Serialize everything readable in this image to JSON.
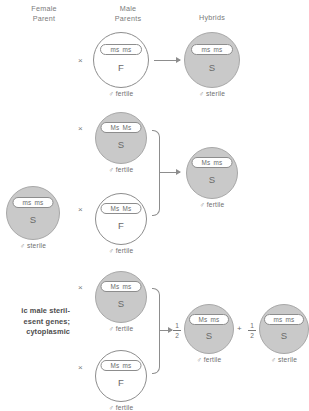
{
  "headers": [
    {
      "id": "female-parent",
      "text": "Female\nParent"
    },
    {
      "id": "male-parents",
      "text": "Male\nParents"
    },
    {
      "id": "hybrids",
      "text": "Hybrids"
    }
  ],
  "symbols": {
    "cross": "×",
    "plus": "+",
    "male": "♂",
    "fertile": "fertile",
    "sterile": "sterile",
    "half_numerator": "1",
    "half_denominator": "2"
  },
  "circles": {
    "r1_male": {
      "alleles": [
        "ms",
        "ms"
      ],
      "cytoplasm": "F",
      "fertility": "♂ fertile",
      "shaded": false
    },
    "r1_hybrid": {
      "alleles": [
        "ms",
        "ms"
      ],
      "cytoplasm": "S",
      "fertility": "♂ sterile",
      "shaded": true
    },
    "female_parent": {
      "alleles": [
        "ms",
        "ms"
      ],
      "cytoplasm": "S",
      "fertility": "♂ sterile",
      "shaded": true
    },
    "r2_male_top": {
      "alleles": [
        "Ms",
        "Ms"
      ],
      "cytoplasm": "S",
      "fertility": "♂ fertile",
      "shaded": true
    },
    "r2_male_bottom": {
      "alleles": [
        "Ms",
        "Ms"
      ],
      "cytoplasm": "F",
      "fertility": "♂ fertile",
      "shaded": false
    },
    "r2_hybrid": {
      "alleles": [
        "Ms",
        "ms"
      ],
      "cytoplasm": "S",
      "fertility": "♂ fertile",
      "shaded": true
    },
    "r3_male_top": {
      "alleles": [
        "Ms",
        "ms"
      ],
      "cytoplasm": "S",
      "fertility": "♂ fertile",
      "shaded": true
    },
    "r3_male_bottom": {
      "alleles": [
        "Ms",
        "ms"
      ],
      "cytoplasm": "F",
      "fertility": "♂ fertile",
      "shaded": false
    },
    "r3_hybrid_left": {
      "alleles": [
        "Ms",
        "ms"
      ],
      "cytoplasm": "S",
      "fertility": "♂ fertile",
      "shaded": true
    },
    "r3_hybrid_right": {
      "alleles": [
        "ms",
        "ms"
      ],
      "cytoplasm": "S",
      "fertility": "♂ sterile",
      "shaded": true
    }
  },
  "caption": "ic male steril-\nesent genes;\ncytoplasmic",
  "colors": {
    "shaded_fill": "#c9c9c9",
    "open_fill": "#ffffff",
    "stroke": "#8d8d8d",
    "text": "#6e6e6e"
  }
}
